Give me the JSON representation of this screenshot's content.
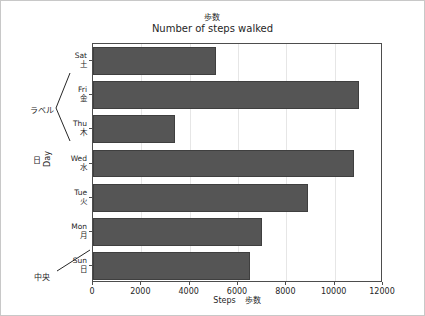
{
  "figure": {
    "suptitle": "歩数",
    "border_color": "#c8c8c8"
  },
  "chart_data": {
    "type": "bar",
    "orientation": "horizontal",
    "title": "Number of steps walked",
    "suptitle": "歩数",
    "xlabel": "Steps",
    "xlabel_jp": "歩数",
    "ylabel": "Day",
    "ylabel_jp": "日",
    "categories": [
      "Sun",
      "Mon",
      "Tue",
      "Wed",
      "Thu",
      "Fri",
      "Sat"
    ],
    "categories_jp": [
      "日",
      "月",
      "火",
      "水",
      "木",
      "金",
      "土"
    ],
    "values": [
      6500,
      7000,
      8900,
      10800,
      3400,
      11000,
      5100
    ],
    "xlim": [
      0,
      12000
    ],
    "xticks": [
      0,
      2000,
      4000,
      6000,
      8000,
      10000,
      12000
    ],
    "xtick_labels": [
      "0",
      "2000",
      "4000",
      "6000",
      "8000",
      "10000",
      "12000"
    ],
    "bar_color": "#555555",
    "grid": true,
    "grid_axis": "x",
    "legend": false
  },
  "annotations": [
    {
      "text": "ラベル",
      "meaning": "label",
      "points_to": "y-tick-labels"
    },
    {
      "text": "中央",
      "meaning": "center",
      "points_to": "sun-tick"
    }
  ],
  "y_axis": {
    "label_en": "Day",
    "label_jp": "日",
    "ticks": [
      {
        "en": "Sat",
        "jp": "土"
      },
      {
        "en": "Fri",
        "jp": "金"
      },
      {
        "en": "Thu",
        "jp": "木"
      },
      {
        "en": "Wed",
        "jp": "水"
      },
      {
        "en": "Tue",
        "jp": "火"
      },
      {
        "en": "Mon",
        "jp": "月"
      },
      {
        "en": "Sun",
        "jp": "日"
      }
    ]
  }
}
